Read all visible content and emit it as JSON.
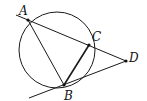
{
  "diagram": {
    "type": "geometry",
    "points": {
      "A": {
        "label": "A",
        "x": 28,
        "y": 20
      },
      "B": {
        "label": "B",
        "x": 64,
        "y": 85
      },
      "C": {
        "label": "C",
        "x": 89,
        "y": 45
      },
      "D": {
        "label": "D",
        "x": 126,
        "y": 61
      }
    },
    "circle": {
      "cx": 57,
      "cy": 50,
      "r": 38
    },
    "segments": [
      "AB",
      "BC",
      "AD",
      "BD"
    ],
    "colors": {
      "stroke": "#1a1a1a",
      "background": "#ffffff"
    }
  }
}
